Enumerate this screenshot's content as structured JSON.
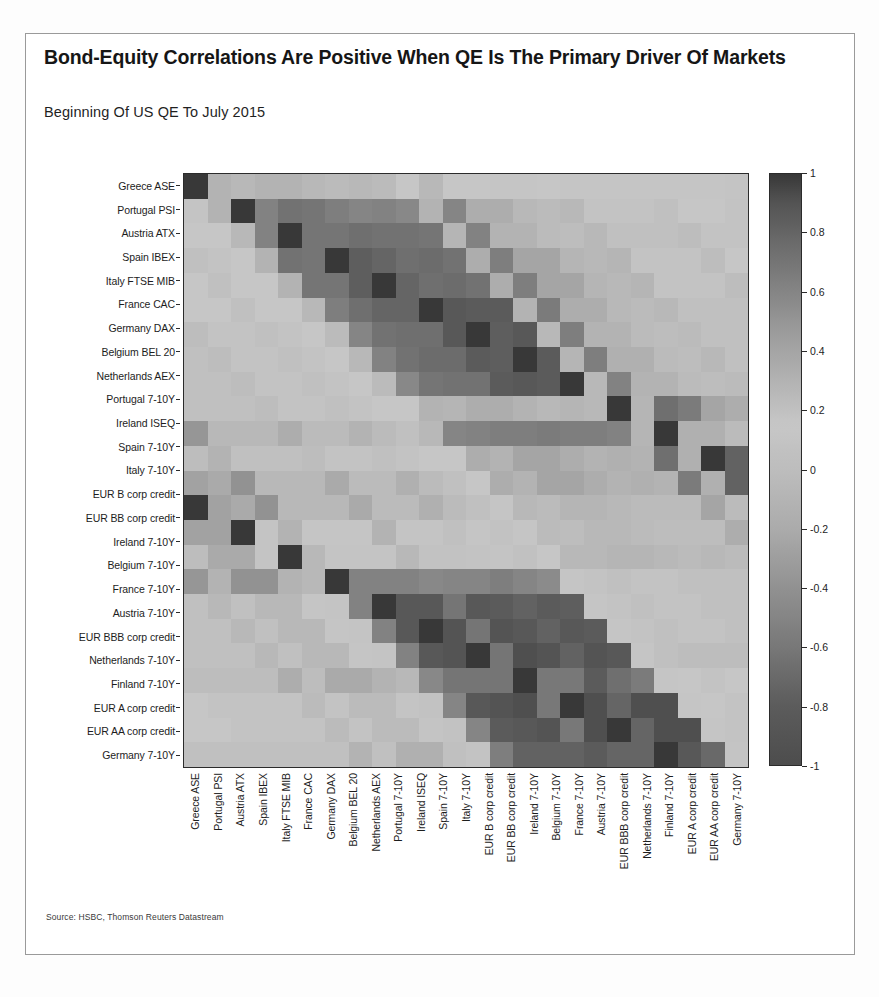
{
  "figure": {
    "title": "Bond-Equity Correlations Are Positive When QE Is The Primary Driver Of Markets",
    "subtitle": "Beginning Of US QE To July 2015",
    "source": "Source: HSBC, Thomson Reuters Datastream"
  },
  "colors": {
    "frame": "#9a9a9a",
    "axis": "#2b2b2b",
    "text": "#1d1d1d",
    "title": "#161616",
    "cmap_high": "#3a3a3a",
    "cmap_mid": "#c9c9c9",
    "cmap_low": "#4a4a4a"
  },
  "chart_data": {
    "type": "heatmap",
    "title": "Bond-Equity Correlations Are Positive When QE Is The Primary Driver Of Markets",
    "subtitle": "Beginning Of US QE To July 2015",
    "xlabel": "",
    "ylabel": "",
    "grid": false,
    "legend_position": "right",
    "colorbar": {
      "min": -1,
      "max": 1,
      "ticks": [
        1,
        0.8,
        0.6,
        0.4,
        0.2,
        0,
        -0.2,
        -0.4,
        -0.6,
        -0.8,
        -1
      ],
      "tick_labels": [
        "1",
        "0.8",
        "0.6",
        "0.4",
        "0.2",
        "0",
        "-0.2",
        "-0.4",
        "-0.6",
        "-0.8",
        "-1"
      ]
    },
    "categories": [
      "Greece ASE",
      "Portugal PSI",
      "Austria ATX",
      "Spain IBEX",
      "Italy FTSE MIB",
      "France CAC",
      "Germany DAX",
      "Belgium BEL 20",
      "Netherlands AEX",
      "Portugal 7-10Y",
      "Ireland ISEQ",
      "Spain 7-10Y",
      "Italy 7-10Y",
      "EUR B corp credit",
      "EUR BB corp credit",
      "Ireland 7-10Y",
      "Belgium 7-10Y",
      "France 7-10Y",
      "Austria 7-10Y",
      "EUR BBB corp credit",
      "Netherlands 7-10Y",
      "Finland 7-10Y",
      "EUR A corp credit",
      "EUR AA corp credit",
      "Germany 7-10Y"
    ],
    "x_categories": [
      "Greece ASE",
      "Portugal PSI",
      "Austria ATX",
      "Spain IBEX",
      "Italy FTSE MIB",
      "France CAC",
      "Germany DAX",
      "Belgium BEL 20",
      "Netherlands AEX",
      "Portugal 7-10Y",
      "Ireland ISEQ",
      "Spain 7-10Y",
      "Italy 7-10Y",
      "EUR B corp credit",
      "EUR BB corp credit",
      "Ireland 7-10Y",
      "Belgium 7-10Y",
      "France 7-10Y",
      "Austria 7-10Y",
      "EUR BBB corp credit",
      "Netherlands 7-10Y",
      "Finland 7-10Y",
      "EUR A corp credit",
      "EUR AA corp credit",
      "Germany 7-10Y"
    ],
    "y_categories": [
      "Greece ASE",
      "Portugal PSI",
      "Austria ATX",
      "Spain IBEX",
      "Italy FTSE MIB",
      "France CAC",
      "Germany DAX",
      "Belgium BEL 20",
      "Netherlands AEX",
      "Portugal 7-10Y",
      "Ireland ISEQ",
      "Spain 7-10Y",
      "Italy 7-10Y",
      "EUR B corp credit",
      "EUR BB corp credit",
      "Ireland 7-10Y",
      "Belgium 7-10Y",
      "France 7-10Y",
      "Austria 7-10Y",
      "EUR BBB corp credit",
      "Netherlands 7-10Y",
      "Finland 7-10Y",
      "EUR A corp credit",
      "EUR AA corp credit",
      "Germany 7-10Y"
    ],
    "matrix": [
      [
        1.0,
        0.3,
        0.26,
        0.3,
        0.3,
        0.26,
        0.24,
        0.26,
        0.24,
        0.14,
        0.26,
        0.16,
        0.16,
        0.12,
        0.12,
        0.14,
        0.12,
        0.12,
        0.12,
        0.12,
        0.12,
        0.12,
        0.12,
        0.1,
        0.1
      ],
      [
        0.3,
        1.0,
        0.62,
        0.72,
        0.7,
        0.64,
        0.6,
        0.62,
        0.58,
        0.3,
        0.6,
        0.34,
        0.34,
        0.26,
        0.24,
        0.26,
        0.18,
        0.18,
        0.18,
        0.2,
        0.16,
        0.16,
        0.18,
        0.16,
        0.14
      ],
      [
        0.26,
        0.62,
        1.0,
        0.7,
        0.7,
        0.74,
        0.72,
        0.72,
        0.7,
        0.28,
        0.62,
        0.3,
        0.3,
        0.24,
        0.22,
        0.26,
        0.2,
        0.2,
        0.2,
        0.22,
        0.18,
        0.18,
        0.2,
        0.18,
        0.16
      ],
      [
        0.3,
        0.72,
        0.7,
        1.0,
        0.84,
        0.8,
        0.74,
        0.76,
        0.72,
        0.34,
        0.64,
        0.4,
        0.4,
        0.28,
        0.26,
        0.28,
        0.18,
        0.18,
        0.18,
        0.22,
        0.16,
        0.16,
        0.2,
        0.16,
        0.14
      ],
      [
        0.3,
        0.7,
        0.7,
        0.84,
        1.0,
        0.8,
        0.74,
        0.76,
        0.72,
        0.34,
        0.64,
        0.4,
        0.4,
        0.28,
        0.26,
        0.28,
        0.18,
        0.18,
        0.18,
        0.22,
        0.16,
        0.16,
        0.2,
        0.16,
        0.14
      ],
      [
        0.26,
        0.64,
        0.74,
        0.8,
        0.8,
        1.0,
        0.88,
        0.86,
        0.86,
        0.3,
        0.66,
        0.34,
        0.34,
        0.26,
        0.24,
        0.26,
        0.2,
        0.2,
        0.2,
        0.22,
        0.18,
        0.18,
        0.2,
        0.18,
        0.16
      ],
      [
        0.24,
        0.6,
        0.72,
        0.74,
        0.74,
        0.88,
        1.0,
        0.84,
        0.88,
        0.26,
        0.64,
        0.3,
        0.3,
        0.24,
        0.22,
        0.24,
        0.2,
        0.2,
        0.2,
        0.22,
        0.18,
        0.18,
        0.2,
        0.18,
        0.16
      ],
      [
        0.26,
        0.62,
        0.72,
        0.76,
        0.76,
        0.86,
        0.84,
        1.0,
        0.86,
        0.28,
        0.64,
        0.32,
        0.32,
        0.24,
        0.22,
        0.26,
        0.2,
        0.2,
        0.2,
        0.22,
        0.18,
        0.18,
        0.2,
        0.18,
        0.16
      ],
      [
        0.24,
        0.58,
        0.7,
        0.72,
        0.72,
        0.86,
        0.88,
        0.86,
        1.0,
        0.26,
        0.62,
        0.3,
        0.3,
        0.24,
        0.22,
        0.24,
        0.2,
        0.2,
        0.2,
        0.22,
        0.18,
        0.18,
        0.2,
        0.18,
        0.16
      ],
      [
        0.14,
        0.3,
        0.28,
        0.34,
        0.34,
        0.3,
        0.26,
        0.28,
        0.26,
        1.0,
        0.28,
        0.74,
        0.66,
        0.4,
        0.34,
        0.5,
        0.26,
        0.26,
        0.26,
        0.34,
        0.24,
        0.24,
        0.3,
        0.24,
        0.2
      ],
      [
        0.26,
        0.6,
        0.62,
        0.64,
        0.64,
        0.66,
        0.64,
        0.64,
        0.62,
        0.28,
        1.0,
        0.32,
        0.32,
        0.24,
        0.22,
        0.3,
        0.2,
        0.2,
        0.2,
        0.22,
        0.18,
        0.18,
        0.2,
        0.18,
        0.16
      ],
      [
        0.16,
        0.34,
        0.3,
        0.4,
        0.4,
        0.34,
        0.3,
        0.32,
        0.3,
        0.74,
        0.32,
        1.0,
        0.82,
        0.42,
        0.36,
        0.52,
        0.26,
        0.26,
        0.26,
        0.36,
        0.24,
        0.24,
        0.32,
        0.24,
        0.2
      ],
      [
        0.16,
        0.34,
        0.3,
        0.4,
        0.4,
        0.34,
        0.3,
        0.32,
        0.3,
        0.66,
        0.32,
        0.82,
        1.0,
        0.42,
        0.36,
        0.52,
        0.26,
        0.26,
        0.26,
        0.36,
        0.24,
        0.24,
        0.32,
        0.24,
        0.2
      ],
      [
        0.12,
        0.26,
        0.24,
        0.28,
        0.28,
        0.26,
        0.24,
        0.24,
        0.24,
        0.4,
        0.24,
        0.42,
        0.42,
        1.0,
        0.1,
        0.3,
        0.12,
        0.12,
        0.12,
        0.3,
        0.1,
        0.1,
        0.2,
        0.12,
        0.08
      ],
      [
        0.12,
        0.24,
        0.22,
        0.26,
        0.26,
        0.24,
        0.22,
        0.22,
        0.22,
        0.34,
        0.22,
        0.36,
        0.36,
        0.1,
        1.0,
        0.26,
        0.1,
        0.1,
        0.1,
        0.26,
        0.08,
        0.08,
        0.18,
        0.1,
        0.06
      ],
      [
        0.14,
        0.26,
        0.26,
        0.28,
        0.28,
        0.26,
        0.24,
        0.26,
        0.24,
        0.5,
        0.3,
        0.52,
        0.52,
        0.3,
        0.26,
        1.0,
        0.62,
        0.62,
        0.62,
        0.58,
        0.6,
        0.6,
        0.64,
        0.6,
        0.56
      ],
      [
        0.12,
        0.18,
        0.2,
        0.18,
        0.18,
        0.2,
        0.2,
        0.2,
        0.2,
        0.26,
        0.2,
        0.26,
        0.26,
        0.12,
        0.1,
        0.62,
        1.0,
        0.88,
        0.88,
        0.7,
        0.88,
        0.86,
        0.82,
        0.86,
        0.84
      ],
      [
        0.12,
        0.18,
        0.2,
        0.18,
        0.18,
        0.2,
        0.2,
        0.2,
        0.2,
        0.26,
        0.2,
        0.26,
        0.26,
        0.12,
        0.1,
        0.62,
        0.88,
        1.0,
        0.9,
        0.7,
        0.9,
        0.88,
        0.82,
        0.88,
        0.86
      ],
      [
        0.12,
        0.18,
        0.2,
        0.18,
        0.18,
        0.2,
        0.2,
        0.2,
        0.2,
        0.26,
        0.2,
        0.26,
        0.26,
        0.12,
        0.1,
        0.62,
        0.88,
        0.9,
        1.0,
        0.7,
        0.92,
        0.9,
        0.82,
        0.9,
        0.88
      ],
      [
        0.12,
        0.2,
        0.22,
        0.22,
        0.22,
        0.22,
        0.22,
        0.22,
        0.22,
        0.34,
        0.22,
        0.36,
        0.36,
        0.3,
        0.26,
        0.58,
        0.7,
        0.7,
        0.7,
        1.0,
        0.68,
        0.68,
        0.86,
        0.74,
        0.66
      ],
      [
        0.12,
        0.16,
        0.18,
        0.16,
        0.16,
        0.18,
        0.18,
        0.18,
        0.18,
        0.24,
        0.18,
        0.24,
        0.24,
        0.1,
        0.08,
        0.6,
        0.88,
        0.9,
        0.92,
        0.68,
        1.0,
        0.92,
        0.8,
        0.92,
        0.92
      ],
      [
        0.12,
        0.16,
        0.18,
        0.16,
        0.16,
        0.18,
        0.18,
        0.18,
        0.18,
        0.24,
        0.18,
        0.24,
        0.24,
        0.1,
        0.08,
        0.6,
        0.86,
        0.88,
        0.9,
        0.68,
        0.92,
        1.0,
        0.8,
        0.92,
        0.92
      ],
      [
        0.12,
        0.18,
        0.2,
        0.2,
        0.2,
        0.2,
        0.2,
        0.2,
        0.2,
        0.3,
        0.2,
        0.32,
        0.32,
        0.2,
        0.18,
        0.64,
        0.82,
        0.82,
        0.82,
        0.86,
        0.8,
        0.8,
        1.0,
        0.88,
        0.78
      ],
      [
        0.1,
        0.16,
        0.18,
        0.16,
        0.16,
        0.18,
        0.18,
        0.18,
        0.18,
        0.24,
        0.18,
        0.24,
        0.24,
        0.12,
        0.1,
        0.6,
        0.86,
        0.88,
        0.9,
        0.74,
        0.92,
        0.92,
        0.88,
        1.0,
        0.92
      ],
      [
        0.1,
        0.14,
        0.16,
        0.14,
        0.14,
        0.16,
        0.16,
        0.16,
        0.16,
        0.2,
        0.16,
        0.2,
        0.2,
        0.08,
        0.06,
        0.56,
        0.84,
        0.86,
        0.88,
        0.66,
        0.92,
        0.92,
        0.78,
        0.92,
        1.0
      ]
    ]
  }
}
